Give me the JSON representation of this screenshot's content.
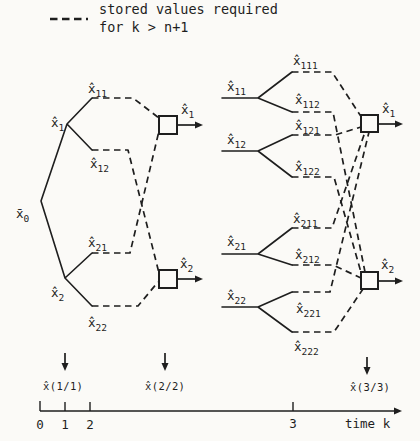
{
  "legend": {
    "line1": "stored values required",
    "line2": "for k > n+1"
  },
  "left_tree": {
    "root": {
      "base": "x̄",
      "sub": "0"
    },
    "nodes": [
      {
        "base": "x̂",
        "sub": "1"
      },
      {
        "base": "x̂",
        "sub": "2"
      },
      {
        "base": "x̂",
        "sub": "11"
      },
      {
        "base": "x̂",
        "sub": "12"
      },
      {
        "base": "x̂",
        "sub": "21"
      },
      {
        "base": "x̂",
        "sub": "22"
      }
    ],
    "outputs": [
      {
        "base": "x̂",
        "sub": "1"
      },
      {
        "base": "x̂",
        "sub": "2"
      }
    ]
  },
  "right_tree": {
    "nodes": [
      {
        "base": "x̂",
        "sub": "11"
      },
      {
        "base": "x̂",
        "sub": "12"
      },
      {
        "base": "x̂",
        "sub": "21"
      },
      {
        "base": "x̂",
        "sub": "22"
      },
      {
        "base": "x̂",
        "sub": "111"
      },
      {
        "base": "x̂",
        "sub": "112"
      },
      {
        "base": "x̂",
        "sub": "121"
      },
      {
        "base": "x̂",
        "sub": "122"
      },
      {
        "base": "x̂",
        "sub": "211"
      },
      {
        "base": "x̂",
        "sub": "212"
      },
      {
        "base": "x̂",
        "sub": "221"
      },
      {
        "base": "x̂",
        "sub": "222"
      }
    ],
    "outputs": [
      {
        "base": "x̂",
        "sub": "1"
      },
      {
        "base": "x̂",
        "sub": "2"
      }
    ]
  },
  "timeline": {
    "markers": [
      "x̂(1/1)",
      "x̂(2/2)",
      "x̂(3/3)"
    ],
    "ticks": [
      "0",
      "1",
      "2",
      "3"
    ],
    "axis_label": "time k"
  },
  "colors": {
    "ink": "#1e1e1e",
    "paper": "#fbfaf7"
  }
}
